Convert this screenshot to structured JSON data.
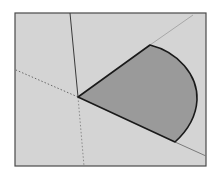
{
  "diagram": {
    "type": "3d-sector-drawing",
    "colors": {
      "background": "#ffffff",
      "viewport_fill": "#d4d4d4",
      "viewport_border": "#4a4a4a",
      "sector_fill": "#9a9a9a",
      "sector_edge": "#1a1a1a",
      "axis_solid": "#3a3a3a",
      "axis_dotted": "#6a6a6a",
      "guide_line": "#a8a8a8"
    },
    "viewport": {
      "x1": 15,
      "y1": 13,
      "x2": 206,
      "y2": 166
    },
    "origin": {
      "x": 78,
      "y": 97
    },
    "sector": {
      "top_tip": {
        "x": 150,
        "y": 45
      },
      "bottom_tip": {
        "x": 175,
        "y": 142
      },
      "arc_rightmost_x": 197
    },
    "axes": {
      "vertical_solid_end": {
        "x": 70,
        "y": 13
      },
      "left_dotted_end": {
        "x": 16,
        "y": 70
      },
      "down_dotted_end": {
        "x": 84,
        "y": 166
      }
    },
    "guides": {
      "upper_extension_end": {
        "x": 193,
        "y": 15
      },
      "lower_extension_end": {
        "x": 206,
        "y": 156
      }
    }
  }
}
